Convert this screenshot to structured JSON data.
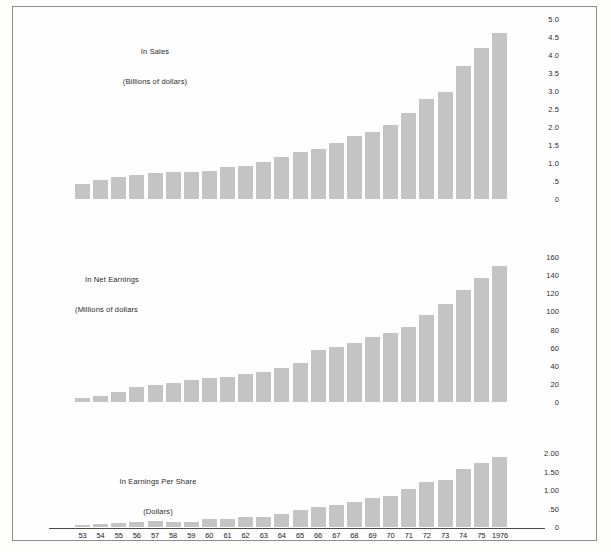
{
  "figure": {
    "background_color": "#fdfdfc",
    "border_color": "#8d8d8d",
    "bar_color": "#c4c4c4"
  },
  "categories": [
    "53",
    "54",
    "55",
    "56",
    "57",
    "58",
    "59",
    "60",
    "61",
    "62",
    "63",
    "64",
    "65",
    "66",
    "67",
    "68",
    "69",
    "70",
    "71",
    "72",
    "73",
    "74",
    "75",
    "1976"
  ],
  "panels": [
    {
      "id": "sales",
      "title_line1": "In Sales",
      "title_line2": "(Billions of dollars)",
      "ticks": [
        "5.0",
        "4.5",
        "4.0",
        "3.5",
        "3.0",
        "2.5",
        "2.0",
        "1.5",
        "1.0",
        ".5",
        "0"
      ]
    },
    {
      "id": "net-earnings",
      "title_line1": "In Net Earnings",
      "title_line2": "(Millions of dollars",
      "ticks": [
        "160",
        "140",
        "120",
        "100",
        "80",
        "60",
        "40",
        "20",
        "0"
      ]
    },
    {
      "id": "earnings-per-share",
      "title_line1": "In Earnings Per Share",
      "title_line2": "(Dollars)",
      "ticks": [
        "2.00",
        "1.50",
        "1.00",
        ".50",
        "0"
      ]
    }
  ],
  "chart_data": [
    {
      "type": "bar",
      "id": "sales",
      "title": "In Sales (Billions of dollars)",
      "xlabel": "",
      "ylabel": "Billions of dollars",
      "categories": [
        "53",
        "54",
        "55",
        "56",
        "57",
        "58",
        "59",
        "60",
        "61",
        "62",
        "63",
        "64",
        "65",
        "66",
        "67",
        "68",
        "69",
        "70",
        "71",
        "72",
        "73",
        "74",
        "75",
        "1976"
      ],
      "values": [
        0.42,
        0.53,
        0.62,
        0.67,
        0.73,
        0.74,
        0.76,
        0.79,
        0.89,
        0.92,
        1.03,
        1.17,
        1.31,
        1.4,
        1.55,
        1.74,
        1.86,
        2.06,
        2.4,
        2.77,
        2.98,
        3.7,
        4.2,
        4.6
      ],
      "ylim": [
        0,
        5.0
      ],
      "yticks": [
        0,
        0.5,
        1.0,
        1.5,
        2.0,
        2.5,
        3.0,
        3.5,
        4.0,
        4.5,
        5.0
      ],
      "ytick_labels": [
        "0",
        ".5",
        "1.0",
        "1.5",
        "2.0",
        "2.5",
        "3.0",
        "3.5",
        "4.0",
        "4.5",
        "5.0"
      ],
      "grid": false,
      "legend": "none"
    },
    {
      "type": "bar",
      "id": "net-earnings",
      "title": "In Net Earnings (Millions of dollars",
      "xlabel": "",
      "ylabel": "Millions of dollars",
      "categories": [
        "53",
        "54",
        "55",
        "56",
        "57",
        "58",
        "59",
        "60",
        "61",
        "62",
        "63",
        "64",
        "65",
        "66",
        "67",
        "68",
        "69",
        "70",
        "71",
        "72",
        "73",
        "74",
        "75",
        "1976"
      ],
      "values": [
        4,
        7,
        11,
        17,
        19,
        21,
        24,
        26,
        28,
        31,
        33,
        37,
        43,
        57,
        61,
        65,
        72,
        76,
        83,
        96,
        108,
        124,
        137,
        150
      ],
      "ylim": [
        0,
        160
      ],
      "yticks": [
        0,
        20,
        40,
        60,
        80,
        100,
        120,
        140,
        160
      ],
      "ytick_labels": [
        "0",
        "20",
        "40",
        "60",
        "80",
        "100",
        "120",
        "140",
        "160"
      ],
      "grid": false,
      "legend": "none"
    },
    {
      "type": "bar",
      "id": "earnings-per-share",
      "title": "In Earnings Per Share (Dollars)",
      "xlabel": "",
      "ylabel": "Dollars",
      "categories": [
        "53",
        "54",
        "55",
        "56",
        "57",
        "58",
        "59",
        "60",
        "61",
        "62",
        "63",
        "64",
        "65",
        "66",
        "67",
        "68",
        "69",
        "70",
        "71",
        "72",
        "73",
        "74",
        "75",
        "1976"
      ],
      "values": [
        0.05,
        0.08,
        0.11,
        0.13,
        0.15,
        0.14,
        0.13,
        0.22,
        0.22,
        0.28,
        0.26,
        0.36,
        0.47,
        0.55,
        0.6,
        0.68,
        0.78,
        0.84,
        1.03,
        1.21,
        1.27,
        1.58,
        1.73,
        1.9
      ],
      "ylim": [
        0,
        2.0
      ],
      "yticks": [
        0,
        0.5,
        1.0,
        1.5,
        2.0
      ],
      "ytick_labels": [
        "0",
        ".50",
        "1.00",
        "1.50",
        "2.00"
      ],
      "grid": false,
      "legend": "none"
    }
  ]
}
